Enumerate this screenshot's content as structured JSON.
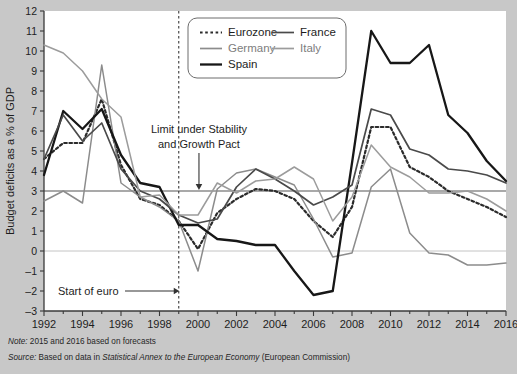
{
  "chart_data": {
    "type": "line",
    "title": "",
    "xlabel": "",
    "ylabel": "Budget deficits as a % of GDP",
    "xlim": [
      1992,
      2016
    ],
    "ylim": [
      -3,
      12
    ],
    "grid": false,
    "legend_position": "top-center",
    "x": [
      1992,
      1993,
      1994,
      1995,
      1996,
      1997,
      1998,
      1999,
      2000,
      2001,
      2002,
      2003,
      2004,
      2005,
      2006,
      2007,
      2008,
      2009,
      2010,
      2011,
      2012,
      2013,
      2014,
      2015,
      2016
    ],
    "y_ticks": [
      -3,
      -2,
      -1,
      0,
      1,
      2,
      3,
      4,
      5,
      6,
      7,
      8,
      9,
      10,
      11,
      12
    ],
    "x_ticks": [
      1992,
      1994,
      1996,
      1998,
      2000,
      2002,
      2004,
      2006,
      2008,
      2010,
      2012,
      2014,
      2016
    ],
    "x_tick_labels": [
      "1992",
      "1994",
      "1996",
      "1998",
      "2000",
      "2002",
      "2004",
      "2006",
      "2008",
      "2010",
      "2012",
      "2014",
      "2016"
    ],
    "series": [
      {
        "name": "Eurozone",
        "color": "#2b2b2b",
        "style": "dotted",
        "width": 2.2,
        "values": [
          4.6,
          5.4,
          5.4,
          7.6,
          4.3,
          2.6,
          2.3,
          1.5,
          0.1,
          1.9,
          2.6,
          3.1,
          3.0,
          2.6,
          1.5,
          0.7,
          2.2,
          6.2,
          6.2,
          4.2,
          3.7,
          3.0,
          2.6,
          2.2,
          1.7
        ]
      },
      {
        "name": "Germany",
        "color": "#8c8c8c",
        "style": "solid",
        "width": 1.5,
        "values": [
          2.5,
          3.0,
          2.4,
          9.3,
          3.4,
          2.7,
          2.2,
          1.5,
          -1.0,
          3.1,
          3.9,
          4.1,
          3.7,
          3.3,
          1.6,
          -0.3,
          -0.1,
          3.2,
          4.1,
          0.9,
          -0.1,
          -0.2,
          -0.7,
          -0.7,
          -0.6
        ]
      },
      {
        "name": "Spain",
        "color": "#171717",
        "style": "solid",
        "width": 2.3,
        "values": [
          3.8,
          7.0,
          6.1,
          7.1,
          4.8,
          3.4,
          3.2,
          1.3,
          1.3,
          0.6,
          0.5,
          0.3,
          0.3,
          -1.0,
          -2.2,
          -2.0,
          4.4,
          11.0,
          9.4,
          9.4,
          10.3,
          6.8,
          5.9,
          4.5,
          3.5
        ]
      },
      {
        "name": "France",
        "color": "#4a4a4a",
        "style": "solid",
        "width": 1.7,
        "values": [
          4.6,
          6.8,
          5.5,
          6.4,
          4.1,
          3.0,
          2.6,
          1.8,
          1.4,
          1.6,
          3.2,
          4.1,
          3.6,
          3.0,
          2.3,
          2.7,
          3.3,
          7.1,
          6.8,
          5.1,
          4.8,
          4.1,
          4.0,
          3.8,
          3.4
        ]
      },
      {
        "name": "Italy",
        "color": "#9c9c9c",
        "style": "solid",
        "width": 1.5,
        "values": [
          10.3,
          9.9,
          9.0,
          7.6,
          6.7,
          2.7,
          2.8,
          1.8,
          1.8,
          3.4,
          2.9,
          3.5,
          3.6,
          4.2,
          3.6,
          1.5,
          2.7,
          5.3,
          4.2,
          3.7,
          2.9,
          2.9,
          3.0,
          2.6,
          2.0
        ]
      }
    ],
    "reference_lines": [
      {
        "name": "stability-pact-limit",
        "axis": "y",
        "value": 3,
        "color": "#555555",
        "style": "solid"
      },
      {
        "name": "zero-line",
        "axis": "y",
        "value": 0,
        "color": "#c4c4c4",
        "style": "solid"
      },
      {
        "name": "euro-start",
        "axis": "x",
        "value": 1999,
        "color": "#3a3a3a",
        "style": "dashed"
      }
    ],
    "annotations": [
      {
        "name": "stability-pact-annotation",
        "text_lines": [
          "Limit under Stability",
          "and Growth Pact"
        ],
        "points_to": {
          "x": 2000,
          "y": 3
        }
      },
      {
        "name": "euro-start-annotation",
        "text_lines": [
          "Start of euro"
        ],
        "points_to": {
          "x": 1999,
          "y": -2
        }
      }
    ]
  },
  "legend": {
    "entries": [
      {
        "label": "Eurozone",
        "color": "#2b2b2b",
        "style": "dotted"
      },
      {
        "label": "France",
        "color": "#4a4a4a",
        "style": "solid"
      },
      {
        "label": "Germany",
        "color": "#8c8c8c",
        "style": "solid"
      },
      {
        "label": "Italy",
        "color": "#9c9c9c",
        "style": "solid"
      },
      {
        "label": "Spain",
        "color": "#171717",
        "style": "solid"
      }
    ]
  },
  "footnotes": {
    "note_label": "Note:",
    "note_text": "2015 and 2016 based on forecasts",
    "source_label": "Source:",
    "source_text_pre": "Based on data in ",
    "source_text_italic": "Statistical Annex to the European Economy",
    "source_text_post": " (European Commission)"
  }
}
